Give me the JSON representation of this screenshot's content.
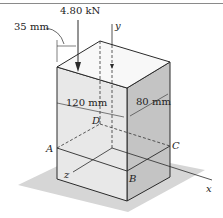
{
  "figure": {
    "load": {
      "label": "4.80 kN",
      "direction": "down"
    },
    "dimensions": {
      "offset": "35 mm",
      "depth": "120 mm",
      "width": "80 mm"
    },
    "axes": {
      "x": "x",
      "y": "y",
      "z": "z"
    },
    "points": {
      "A": "A",
      "B": "B",
      "C": "C",
      "D": "D"
    },
    "colors": {
      "front_face": "#e6e6e6",
      "side_face": "#c6c6c6",
      "top_face": "#f7f7f7",
      "shadow": "#d4d4d4",
      "line": "#2a2a2a"
    }
  }
}
